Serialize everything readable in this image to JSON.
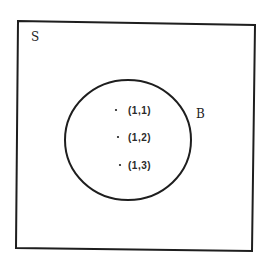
{
  "diagram": {
    "type": "venn",
    "universe": {
      "label": "S",
      "stroke_color": "#1e1e1e",
      "corners": [
        [
          18,
          21
        ],
        [
          255,
          25
        ],
        [
          252,
          251
        ],
        [
          16,
          248
        ]
      ]
    },
    "set_b": {
      "label": "B",
      "stroke_color": "#1e1e1e",
      "center": [
        128,
        140
      ],
      "rx": 63,
      "ry": 60
    },
    "elements": [
      {
        "label": "(1,1)",
        "dot": [
          116,
          110
        ]
      },
      {
        "label": "(1,2)",
        "dot": [
          118,
          137
        ]
      },
      {
        "label": "(1,3)",
        "dot": [
          120,
          165
        ]
      }
    ],
    "colors": {
      "background": "#ffffff",
      "ink": "#1e1e1e"
    }
  }
}
